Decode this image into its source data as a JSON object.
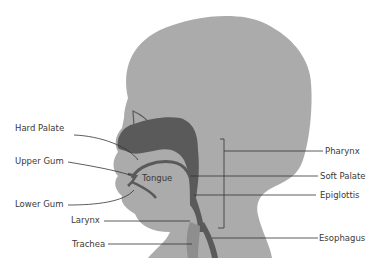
{
  "diagram": {
    "colors": {
      "head": "#ababab",
      "dark_structure": "#5a5a5a",
      "airway": "#8e8e8e",
      "line": "#333333",
      "text": "#3a3a3a"
    },
    "labels_left": [
      {
        "text": "Hard Palate"
      },
      {
        "text": "Upper Gum"
      },
      {
        "text": "Lower Gum"
      },
      {
        "text": "Larynx"
      },
      {
        "text": "Trachea"
      }
    ],
    "labels_right": [
      {
        "text": "Pharynx"
      },
      {
        "text": "Soft Palate"
      },
      {
        "text": "Epiglottis"
      },
      {
        "text": "Esophagus"
      }
    ],
    "inner_label": {
      "text": "Tongue"
    }
  }
}
